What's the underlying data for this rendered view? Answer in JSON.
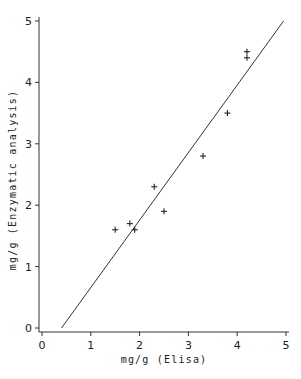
{
  "chart_data": {
    "type": "scatter",
    "title": "",
    "xlabel": "mg/g (Elisa)",
    "ylabel": "mg/g (Enzymatic analysis)",
    "xlim": [
      0,
      5
    ],
    "ylim": [
      0,
      5
    ],
    "xticks": [
      0,
      1,
      2,
      3,
      4,
      5
    ],
    "yticks": [
      0,
      1,
      2,
      3,
      4,
      5
    ],
    "grid": false,
    "legend": null,
    "marker": "+",
    "series": [
      {
        "name": "samples",
        "points": [
          {
            "x": 1.5,
            "y": 1.6
          },
          {
            "x": 1.8,
            "y": 1.7
          },
          {
            "x": 1.9,
            "y": 1.6
          },
          {
            "x": 2.3,
            "y": 2.3
          },
          {
            "x": 2.5,
            "y": 1.9
          },
          {
            "x": 3.3,
            "y": 2.8
          },
          {
            "x": 3.8,
            "y": 3.5
          },
          {
            "x": 4.2,
            "y": 4.4
          },
          {
            "x": 4.2,
            "y": 4.5
          }
        ]
      }
    ],
    "fit_line": {
      "x1": 0.4,
      "y1": 0.0,
      "x2": 4.95,
      "y2": 5.0
    }
  },
  "axes": {
    "x_title": "mg/g (Elisa)",
    "y_title": "mg/g (Enzymatic analysis)",
    "x_tick_labels": [
      "0",
      "1",
      "2",
      "3",
      "4",
      "5"
    ],
    "y_tick_labels": [
      "0",
      "1",
      "2",
      "3",
      "4",
      "5"
    ]
  }
}
